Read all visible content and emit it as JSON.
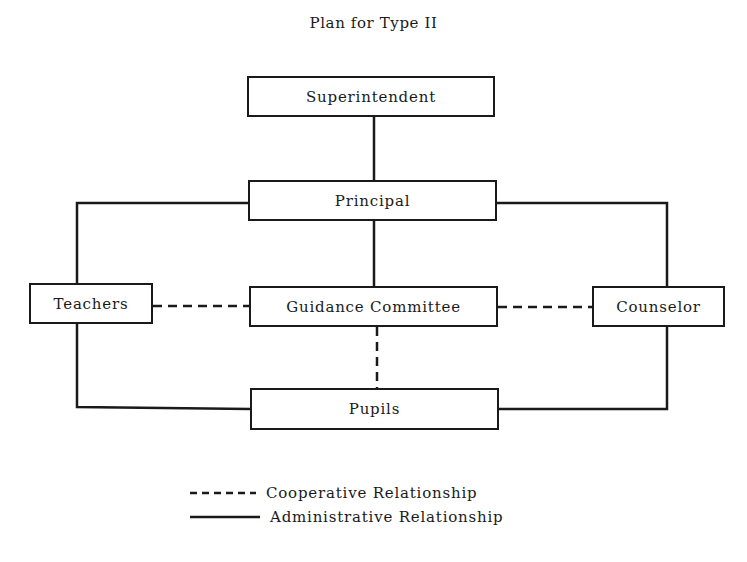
{
  "title": "Plan for Type II",
  "nodes": {
    "superintendent": "Superintendent",
    "principal": "Principal",
    "teachers": "Teachers",
    "guidance_committee": "Guidance Committee",
    "counselor": "Counselor",
    "pupils": "Pupils"
  },
  "edges": [
    {
      "from": "Superintendent",
      "to": "Principal",
      "type": "administrative"
    },
    {
      "from": "Principal",
      "to": "Teachers",
      "type": "administrative"
    },
    {
      "from": "Principal",
      "to": "Counselor",
      "type": "administrative"
    },
    {
      "from": "Principal",
      "to": "Guidance Committee",
      "type": "administrative"
    },
    {
      "from": "Teachers",
      "to": "Guidance Committee",
      "type": "cooperative"
    },
    {
      "from": "Guidance Committee",
      "to": "Counselor",
      "type": "cooperative"
    },
    {
      "from": "Guidance Committee",
      "to": "Pupils",
      "type": "cooperative"
    },
    {
      "from": "Teachers",
      "to": "Pupils",
      "type": "administrative"
    },
    {
      "from": "Counselor",
      "to": "Pupils",
      "type": "administrative"
    }
  ],
  "legend": {
    "cooperative": "Cooperative Relationship",
    "administrative": "Administrative Relationship"
  },
  "colors": {
    "line": "#1a1a1a",
    "background": "#ffffff"
  }
}
